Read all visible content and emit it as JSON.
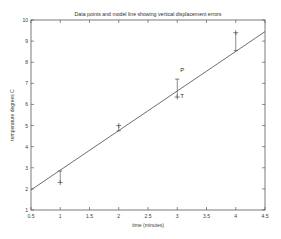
{
  "chart_data": {
    "type": "scatter",
    "title": "Data points and model line showing vertical displacement errors",
    "xlabel": "time (minutes)",
    "ylabel": "temperature degrees C",
    "xlim": [
      0.5,
      4.5
    ],
    "ylim": [
      1,
      10
    ],
    "grid": false,
    "legend": "none",
    "xticks": [
      "0.5",
      "1",
      "1.5",
      "2",
      "2.5",
      "3",
      "3.5",
      "4",
      "4.5"
    ],
    "xtick_values": [
      0.5,
      1,
      1.5,
      2,
      2.5,
      3,
      3.5,
      4,
      4.5
    ],
    "yticks": [
      "1",
      "2",
      "3",
      "4",
      "5",
      "6",
      "7",
      "8",
      "9",
      "10"
    ],
    "ytick_values": [
      1,
      2,
      3,
      4,
      5,
      6,
      7,
      8,
      9,
      10
    ],
    "series": [
      {
        "name": "data points",
        "marker": "plus",
        "x": [
          1,
          2,
          3,
          4
        ],
        "y": [
          2.3,
          5.0,
          6.35,
          9.4
        ]
      },
      {
        "name": "model line",
        "type": "line",
        "x": [
          0.5,
          4.5
        ],
        "y": [
          1.95,
          9.45
        ]
      }
    ],
    "error_segments": [
      {
        "x": 1,
        "y_data": 2.3,
        "y_model": 2.85
      },
      {
        "x": 2,
        "y_data": 5.0,
        "y_model": 4.75
      },
      {
        "x": 3,
        "y_data": 6.35,
        "y_model": 7.2
      },
      {
        "x": 4,
        "y_data": 9.4,
        "y_model": 8.55
      }
    ],
    "annotations": [
      {
        "label": "P",
        "x": 3.05,
        "y": 7.55
      },
      {
        "label": "T",
        "x": 3.05,
        "y": 6.3
      }
    ]
  },
  "axes": {
    "x_axis_title": "time (minutes)",
    "y_axis_title": "temperature degrees C"
  },
  "figure": {
    "title": "Data points and model line showing vertical displacement errors",
    "colors": {
      "axis": "#5a5a5a",
      "line": "#4a4a4a",
      "text": "#3a3a3a",
      "background": "#ffffff"
    }
  }
}
